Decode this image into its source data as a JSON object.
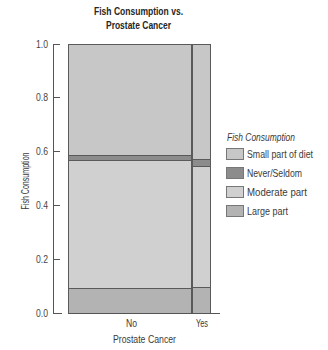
{
  "chart_data": {
    "type": "bar",
    "subtype": "mosaic",
    "stacked": true,
    "title": "Fish Consumption vs. Prostate Cancer",
    "title_lines": [
      "Fish Consumption vs.",
      "Prostate Cancer"
    ],
    "xlabel": "Prostate Cancer",
    "ylabel": "Fish Consumption",
    "categories": [
      "No",
      "Yes"
    ],
    "category_widths": [
      0.867,
      0.133
    ],
    "series": [
      {
        "name": "Large part",
        "values": [
          0.093,
          0.096
        ],
        "color": "#b3b3b3"
      },
      {
        "name": "Moderate part",
        "values": [
          0.477,
          0.452
        ],
        "color": "#d0d0d0"
      },
      {
        "name": "Never/Seldom",
        "values": [
          0.019,
          0.026
        ],
        "color": "#8c8c8c"
      },
      {
        "name": "Small part of diet",
        "values": [
          0.411,
          0.426
        ],
        "color": "#c7c7c7"
      }
    ],
    "ylim": [
      0,
      1
    ],
    "yticks": [
      "0.0",
      "0.2",
      "0.4",
      "0.6",
      "0.8",
      "1.0"
    ],
    "grid": false,
    "legend": {
      "title": "Fish Consumption",
      "position": "right",
      "entries": [
        {
          "label": "Small part of diet",
          "color": "#c7c7c7"
        },
        {
          "label": "Never/Seldom",
          "color": "#8c8c8c"
        },
        {
          "label": "Moderate part",
          "color": "#d0d0d0"
        },
        {
          "label": "Large part",
          "color": "#b3b3b3"
        }
      ]
    },
    "colors": {
      "outline": "#5a5a5a",
      "axis": "#555555",
      "text": "#333333"
    }
  }
}
